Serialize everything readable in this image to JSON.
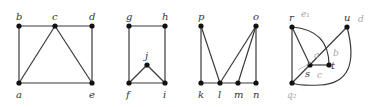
{
  "diagram": {
    "type": "graph-figures",
    "colors": {
      "edge": "#3a3a3a",
      "node": "#111111",
      "label": "#333333",
      "annotation": "#a8a8a8"
    },
    "graphs": [
      {
        "id": "graph-1",
        "nodes": [
          {
            "label": "b",
            "x": 19,
            "y": 26
          },
          {
            "label": "c",
            "x": 55,
            "y": 26
          },
          {
            "label": "d",
            "x": 92,
            "y": 26
          },
          {
            "label": "a",
            "x": 19,
            "y": 83
          },
          {
            "label": "e",
            "x": 92,
            "y": 83
          }
        ],
        "edges": [
          [
            "b",
            "c"
          ],
          [
            "c",
            "d"
          ],
          [
            "b",
            "a"
          ],
          [
            "d",
            "e"
          ],
          [
            "a",
            "e"
          ],
          [
            "c",
            "a"
          ],
          [
            "c",
            "e"
          ]
        ]
      },
      {
        "id": "graph-2",
        "nodes": [
          {
            "label": "g",
            "x": 129,
            "y": 26
          },
          {
            "label": "h",
            "x": 165,
            "y": 26
          },
          {
            "label": "j",
            "x": 147,
            "y": 65
          },
          {
            "label": "f",
            "x": 129,
            "y": 83
          },
          {
            "label": "i",
            "x": 165,
            "y": 83
          }
        ],
        "edges": [
          [
            "g",
            "h"
          ],
          [
            "g",
            "f"
          ],
          [
            "h",
            "i"
          ],
          [
            "f",
            "i"
          ],
          [
            "f",
            "j"
          ],
          [
            "j",
            "i"
          ]
        ]
      },
      {
        "id": "graph-3",
        "nodes": [
          {
            "label": "p",
            "x": 201,
            "y": 26
          },
          {
            "label": "o",
            "x": 256,
            "y": 26
          },
          {
            "label": "k",
            "x": 201,
            "y": 83
          },
          {
            "label": "l",
            "x": 220,
            "y": 83
          },
          {
            "label": "m",
            "x": 238,
            "y": 83
          },
          {
            "label": "n",
            "x": 256,
            "y": 83
          }
        ],
        "edges": [
          [
            "p",
            "k"
          ],
          [
            "p",
            "l"
          ],
          [
            "o",
            "l"
          ],
          [
            "o",
            "m"
          ],
          [
            "o",
            "n"
          ],
          [
            "k",
            "l"
          ],
          [
            "l",
            "m"
          ],
          [
            "m",
            "n"
          ]
        ]
      },
      {
        "id": "graph-4",
        "nodes": [
          {
            "label": "r",
            "x": 292,
            "y": 27
          },
          {
            "label": "u",
            "x": 347,
            "y": 27
          },
          {
            "label": "s",
            "x": 310,
            "y": 65
          },
          {
            "label": "t",
            "x": 329,
            "y": 65
          },
          {
            "label": "q",
            "x": 292,
            "y": 83
          }
        ],
        "edges": [
          [
            "r",
            "q"
          ],
          [
            "r",
            "s"
          ],
          [
            "s",
            "t"
          ],
          [
            "q",
            "u"
          ]
        ],
        "curved_edges": [
          [
            "r",
            "t"
          ],
          [
            "u",
            "q"
          ]
        ],
        "annotations": [
          "e1",
          "a",
          "b",
          "c",
          "q",
          "d"
        ]
      }
    ]
  },
  "labels": {
    "a": "a",
    "b": "b",
    "c": "c",
    "d": "d",
    "e": "e",
    "f": "f",
    "g": "g",
    "h": "h",
    "i": "i",
    "j": "j",
    "k": "k",
    "l": "l",
    "m": "m",
    "n": "n",
    "o": "o",
    "p": "p",
    "q": "q",
    "r": "r",
    "s": "s",
    "t": "t",
    "u": "u"
  },
  "handwritten": {
    "e1": "e₁",
    "a": "a",
    "b": "b",
    "c": "c",
    "q2": "q₂",
    "d": "d"
  }
}
